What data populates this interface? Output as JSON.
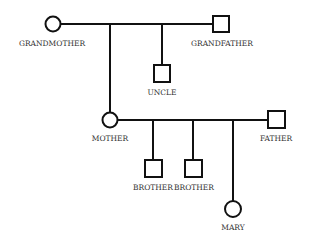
{
  "diagram": {
    "type": "pedigree",
    "members": {
      "grandmother": {
        "label": "GRANDMOTHER",
        "sex": "female"
      },
      "grandfather": {
        "label": "GRANDFATHER",
        "sex": "male"
      },
      "uncle": {
        "label": "UNCLE",
        "sex": "male"
      },
      "mother": {
        "label": "MOTHER",
        "sex": "female"
      },
      "father": {
        "label": "FATHER",
        "sex": "male"
      },
      "brother1": {
        "label": "BROTHER",
        "sex": "male"
      },
      "brother2": {
        "label": "BROTHER",
        "sex": "male"
      },
      "mary": {
        "label": "MARY",
        "sex": "female"
      }
    },
    "relations": [
      {
        "couple": [
          "grandmother",
          "grandfather"
        ],
        "children": [
          "mother",
          "uncle"
        ]
      },
      {
        "couple": [
          "mother",
          "father"
        ],
        "children": [
          "brother1",
          "brother2",
          "mary"
        ]
      }
    ],
    "colors": {
      "stroke": "#111111",
      "text": "#333333",
      "background": "#ffffff"
    }
  }
}
